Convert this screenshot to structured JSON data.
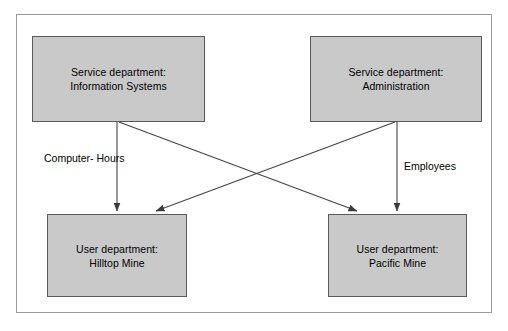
{
  "diagram": {
    "title_present": false,
    "nodes": [
      {
        "id": "information-systems",
        "line1": "Service department:",
        "line2": "Information Systems",
        "role": "service",
        "fill": "#c9c9c9",
        "stroke": "#5a5a5a"
      },
      {
        "id": "administration",
        "line1": "Service department:",
        "line2": "Administration",
        "role": "service",
        "fill": "#c9c9c9",
        "stroke": "#5a5a5a"
      },
      {
        "id": "hilltop-mine",
        "line1": "User department:",
        "line2": "Hilltop Mine",
        "role": "user",
        "fill": "#c9c9c9",
        "stroke": "#5a5a5a"
      },
      {
        "id": "pacific-mine",
        "line1": "User department:",
        "line2": "Pacific Mine",
        "role": "user",
        "fill": "#c9c9c9",
        "stroke": "#5a5a5a"
      }
    ],
    "edge_labels": {
      "left": {
        "line1": "Computer-",
        "line2": "Hours"
      },
      "right": {
        "line1": "Employees"
      }
    },
    "edges": [
      {
        "from": "information-systems",
        "to": "hilltop-mine",
        "label": "Computer-Hours",
        "style": "straight-vertical"
      },
      {
        "from": "information-systems",
        "to": "pacific-mine",
        "label": "Computer-Hours",
        "style": "diagonal"
      },
      {
        "from": "administration",
        "to": "hilltop-mine",
        "label": "Employees",
        "style": "diagonal"
      },
      {
        "from": "administration",
        "to": "pacific-mine",
        "label": "Employees",
        "style": "straight-vertical"
      }
    ],
    "colors": {
      "box_fill": "#c9c9c9",
      "box_stroke": "#5a5a5a",
      "line": "#444444",
      "frame": "#9a9a9a",
      "background": "#ffffff",
      "text": "#000000"
    }
  }
}
